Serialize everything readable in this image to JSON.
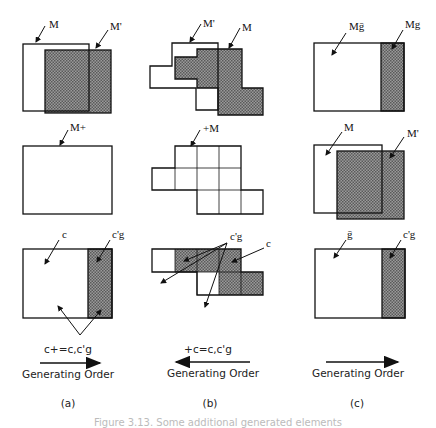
{
  "colors": {
    "stroke": "#111111",
    "hatch_fill": "#8a8a8a",
    "background": "#ffffff"
  },
  "panels": [
    {
      "id": "a",
      "label": "(a)",
      "rows": [
        {
          "labels": [
            "M",
            "M'"
          ]
        },
        {
          "labels": [
            "M+"
          ]
        },
        {
          "labels": [
            "c",
            "c'g"
          ]
        }
      ],
      "formula": "c+=c,c'g",
      "arrow_direction": "right",
      "order_label": "Generating Order"
    },
    {
      "id": "b",
      "label": "(b)",
      "rows": [
        {
          "labels": [
            "M'",
            "M"
          ]
        },
        {
          "labels": [
            "+M"
          ]
        },
        {
          "labels": [
            "c'g",
            "c"
          ]
        }
      ],
      "formula": "+c=c,c'g",
      "arrow_direction": "left",
      "order_label": "Generating Order"
    },
    {
      "id": "c",
      "label": "(c)",
      "rows": [
        {
          "labels": [
            "Mḡ",
            "Mg"
          ]
        },
        {
          "labels": [
            "M",
            "M'"
          ]
        },
        {
          "labels": [
            "ḡ",
            "c'g"
          ]
        }
      ],
      "formula": "",
      "arrow_direction": "right",
      "order_label": "Generating Order"
    }
  ],
  "caption": "Figure 3.13. Some additional generated elements"
}
